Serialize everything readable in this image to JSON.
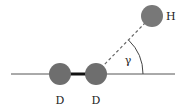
{
  "diagram": {
    "axis_line": {
      "x1": 11,
      "y1": 74,
      "x2": 175,
      "y2": 74,
      "color": "#555555"
    },
    "atoms": [
      {
        "id": "D1",
        "label": "D",
        "cx": 60,
        "cy": 74,
        "r": 11,
        "color": "#6e6e6e"
      },
      {
        "id": "D2",
        "label": "D",
        "cx": 96,
        "cy": 74,
        "r": 11,
        "color": "#6e6e6e"
      },
      {
        "id": "H",
        "label": "H",
        "cx": 152,
        "cy": 16,
        "r": 11,
        "color": "#787878"
      }
    ],
    "bond": {
      "from": "D1",
      "to": "D2",
      "color": "#111111",
      "width": 3
    },
    "dashed_line": {
      "from": "D2",
      "to": "H",
      "color": "#666666"
    },
    "angle": {
      "label": "γ",
      "vertex": "D2",
      "radius": 47,
      "label_x": 125,
      "label_y": 63
    },
    "labels": {
      "d1": "D",
      "d2": "D",
      "h": "H",
      "gamma": "γ"
    }
  }
}
